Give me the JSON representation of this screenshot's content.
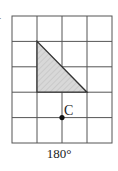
{
  "diagram": {
    "grid": {
      "cols": 4,
      "rows": 5,
      "x0": 12,
      "y0": 16,
      "cell_w": 25,
      "cell_h": 25.4,
      "line_color": "#555555"
    },
    "shape": {
      "type": "right-triangle",
      "vertices_grid": [
        [
          1,
          1
        ],
        [
          1,
          3
        ],
        [
          3,
          3
        ]
      ],
      "fill": "#d6d6d6",
      "stroke": "#333333"
    },
    "point": {
      "label": "C",
      "grid": [
        2,
        4
      ],
      "color": "#111111"
    },
    "caption": "180°",
    "corner_mark": "·"
  }
}
